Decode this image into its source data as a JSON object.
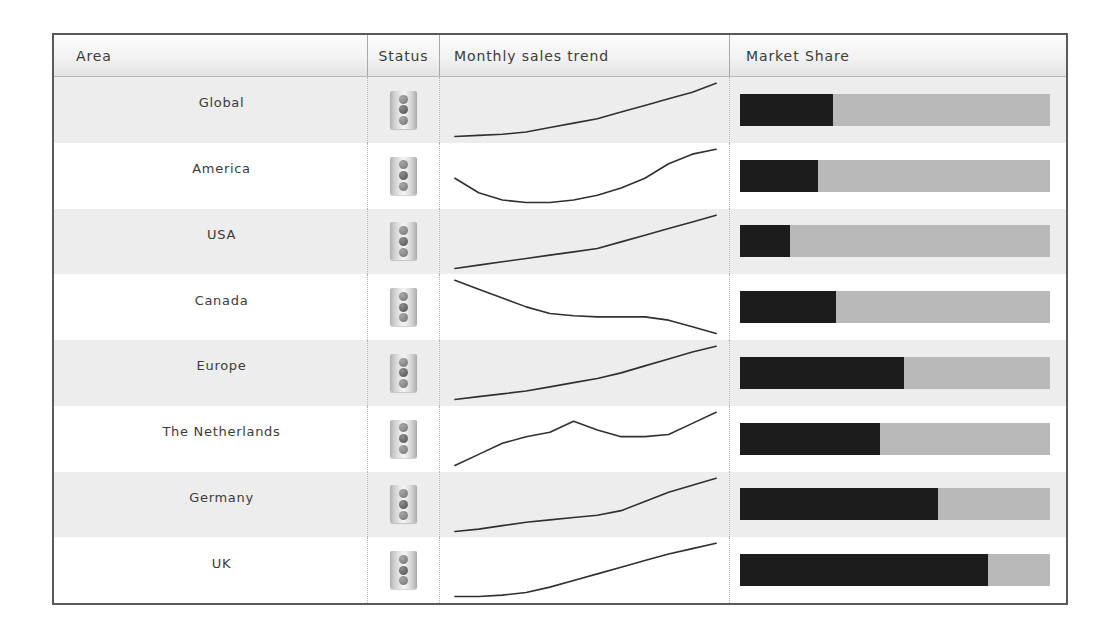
{
  "table": {
    "columns": [
      {
        "key": "area",
        "label": "Area"
      },
      {
        "key": "status",
        "label": "Status"
      },
      {
        "key": "trend",
        "label": "Monthly sales trend"
      },
      {
        "key": "share",
        "label": "Market Share"
      }
    ],
    "rows": [
      {
        "area": "Global",
        "status_icon": "traffic-light-icon",
        "status_label": "Traffic light status indicator",
        "trend_points": [
          10,
          10.5,
          11,
          12,
          14,
          16,
          18,
          21,
          24,
          27,
          30,
          34
        ],
        "share_percent": 30
      },
      {
        "area": "America",
        "status_icon": "traffic-light-icon",
        "status_label": "Traffic light status indicator",
        "trend_points": [
          22,
          19,
          17.5,
          17,
          17,
          17.5,
          18.5,
          20,
          22,
          25,
          27,
          28
        ],
        "share_percent": 25
      },
      {
        "area": "USA",
        "status_icon": "traffic-light-icon",
        "status_label": "Traffic light status indicator",
        "trend_points": [
          12,
          13.5,
          15,
          16.5,
          18,
          19.5,
          21,
          24,
          27,
          30,
          33,
          36
        ],
        "share_percent": 16
      },
      {
        "area": "Canada",
        "status_icon": "traffic-light-icon",
        "status_label": "Traffic light status indicator",
        "trend_points": [
          34,
          30,
          26,
          22,
          19,
          18,
          17.5,
          17.5,
          17.5,
          16,
          13,
          10
        ],
        "share_percent": 31
      },
      {
        "area": "Europe",
        "status_icon": "traffic-light-icon",
        "status_label": "Traffic light status indicator",
        "trend_points": [
          14,
          15,
          16,
          17,
          18.5,
          20,
          21.5,
          23.5,
          26,
          28.5,
          31,
          33
        ],
        "share_percent": 53
      },
      {
        "area": "The Netherlands",
        "status_icon": "traffic-light-icon",
        "status_label": "Traffic light status indicator",
        "trend_points": [
          8,
          13,
          18,
          21,
          23,
          28,
          24,
          21,
          21,
          22,
          27,
          32
        ],
        "share_percent": 45
      },
      {
        "area": "Germany",
        "status_icon": "traffic-light-icon",
        "status_label": "Traffic light status indicator",
        "trend_points": [
          12,
          13,
          14.5,
          16,
          17,
          18,
          19,
          21,
          25,
          29,
          32,
          35
        ],
        "share_percent": 64
      },
      {
        "area": "UK",
        "status_icon": "traffic-light-icon",
        "status_label": "Traffic light status indicator",
        "trend_points": [
          10,
          10,
          10.5,
          11.5,
          13.5,
          16,
          18.5,
          21,
          23.5,
          26,
          28,
          30
        ],
        "share_percent": 80
      }
    ]
  },
  "chart_data": [
    {
      "type": "line",
      "title": "Monthly sales trend",
      "xlabel": "",
      "ylabel": "",
      "x": [
        1,
        2,
        3,
        4,
        5,
        6,
        7,
        8,
        9,
        10,
        11,
        12
      ],
      "series": [
        {
          "name": "Global",
          "values": [
            10,
            10.5,
            11,
            12,
            14,
            16,
            18,
            21,
            24,
            27,
            30,
            34
          ]
        },
        {
          "name": "America",
          "values": [
            22,
            19,
            17.5,
            17,
            17,
            17.5,
            18.5,
            20,
            22,
            25,
            27,
            28
          ]
        },
        {
          "name": "USA",
          "values": [
            12,
            13.5,
            15,
            16.5,
            18,
            19.5,
            21,
            24,
            27,
            30,
            33,
            36
          ]
        },
        {
          "name": "Canada",
          "values": [
            34,
            30,
            26,
            22,
            19,
            18,
            17.5,
            17.5,
            17.5,
            16,
            13,
            10
          ]
        },
        {
          "name": "Europe",
          "values": [
            14,
            15,
            16,
            17,
            18.5,
            20,
            21.5,
            23.5,
            26,
            28.5,
            31,
            33
          ]
        },
        {
          "name": "The Netherlands",
          "values": [
            8,
            13,
            18,
            21,
            23,
            28,
            24,
            21,
            21,
            22,
            27,
            32
          ]
        },
        {
          "name": "Germany",
          "values": [
            12,
            13,
            14.5,
            16,
            17,
            18,
            19,
            21,
            25,
            29,
            32,
            35
          ]
        },
        {
          "name": "UK",
          "values": [
            10,
            10,
            10.5,
            11.5,
            13.5,
            16,
            18.5,
            21,
            23.5,
            26,
            28,
            30
          ]
        }
      ],
      "grid": false,
      "legend": "none"
    },
    {
      "type": "bar",
      "title": "Market Share",
      "xlabel": "",
      "ylabel": "",
      "orientation": "horizontal",
      "categories": [
        "Global",
        "America",
        "USA",
        "Canada",
        "Europe",
        "The Netherlands",
        "Germany",
        "UK"
      ],
      "values": [
        30,
        25,
        16,
        31,
        53,
        45,
        64,
        80
      ],
      "xlim": [
        0,
        100
      ],
      "grid": false,
      "legend": "none"
    }
  ],
  "colors": {
    "frame_border": "#5a5a5a",
    "header_text": "#3c3c3c",
    "row_shade": "#ededed",
    "row_plain": "#ffffff",
    "bar_fill": "#1c1c1c",
    "bar_track": "#b9b9b9",
    "spark_line": "#303030"
  }
}
